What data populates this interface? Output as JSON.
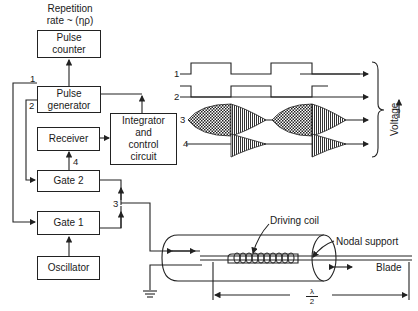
{
  "diagram": {
    "title": "Repetition\nrate ~ (ηρ)",
    "blocks": {
      "pulse_counter": "Pulse\ncounter",
      "pulse_generator": "Pulse\ngenerator",
      "receiver": "Receiver",
      "integrator": "Integrator\nand\ncontrol\ncircuit",
      "gate2": "Gate 2",
      "gate1": "Gate 1",
      "oscillator": "Oscillator"
    },
    "signal_labels": {
      "s1": "1",
      "s2": "2",
      "s3": "3",
      "s4": "4"
    },
    "waveforms": {
      "labels": [
        "1",
        "2",
        "3",
        "4"
      ],
      "axis_label": "Voltage"
    },
    "transducer": {
      "driving_coil": "Driving coil",
      "nodal_support": "Nodal support",
      "blade": "Blade",
      "length_num": "λ",
      "length_den": "2"
    },
    "colors": {
      "line": "#222222",
      "background": "#ffffff"
    }
  }
}
